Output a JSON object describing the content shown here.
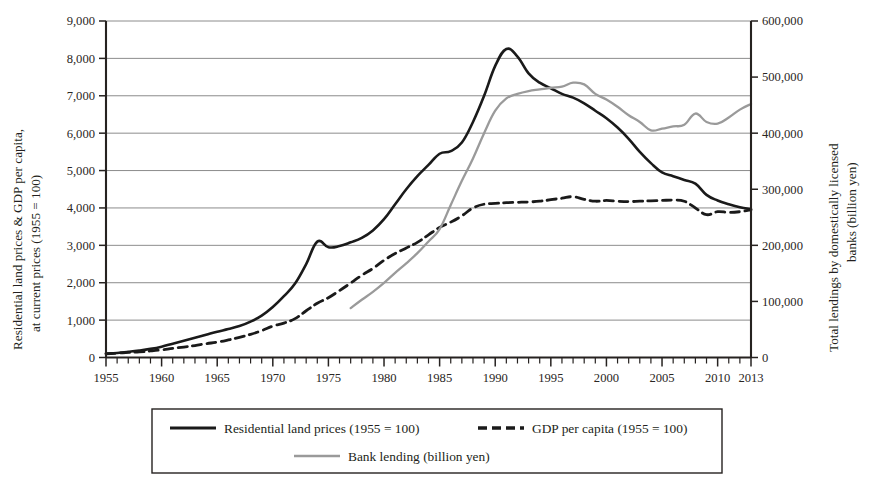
{
  "chart_data": {
    "type": "line",
    "title": "",
    "subtitle": "",
    "xlabel": "",
    "ylabel": "Residential land prices & GDP per capita, at current prices (1955 = 100)",
    "y2label": "Total lendings by domestically licensed banks (billion yen)",
    "xlim": [
      1955,
      2013
    ],
    "ylim": [
      0,
      9000
    ],
    "y2lim": [
      0,
      600000
    ],
    "grid": true,
    "grid_axis": "y",
    "legend_position": "bottom",
    "x_tick_labels": [
      "1955",
      "1960",
      "1965",
      "1970",
      "1975",
      "1980",
      "1985",
      "1990",
      "1995",
      "2000",
      "2005",
      "2010",
      "2013"
    ],
    "x_tick_values": [
      1955,
      1960,
      1965,
      1970,
      1975,
      1980,
      1985,
      1990,
      1995,
      2000,
      2005,
      2010,
      2013
    ],
    "x_minor_tick_step": 1,
    "y_tick_labels": [
      "0",
      "1,000",
      "2,000",
      "3,000",
      "4,000",
      "5,000",
      "6,000",
      "7,000",
      "8,000",
      "9,000"
    ],
    "y_tick_values": [
      0,
      1000,
      2000,
      3000,
      4000,
      5000,
      6000,
      7000,
      8000,
      9000
    ],
    "y2_tick_labels": [
      "0",
      "100,000",
      "200,000",
      "300,000",
      "400,000",
      "500,000",
      "600,000"
    ],
    "y2_tick_values": [
      0,
      100000,
      200000,
      300000,
      400000,
      500000,
      600000
    ],
    "series": [
      {
        "name": "Residential land prices (1955 = 100)",
        "axis": "left",
        "style": "solid",
        "color": "#1a1a1a",
        "width": 2.6,
        "x": [
          1955,
          1956,
          1957,
          1958,
          1959,
          1960,
          1961,
          1962,
          1963,
          1964,
          1965,
          1966,
          1967,
          1968,
          1969,
          1970,
          1971,
          1972,
          1973,
          1974,
          1975,
          1976,
          1977,
          1978,
          1979,
          1980,
          1981,
          1982,
          1983,
          1984,
          1985,
          1986,
          1987,
          1988,
          1989,
          1990,
          1991,
          1992,
          1993,
          1994,
          1995,
          1996,
          1997,
          1998,
          1999,
          2000,
          2001,
          2002,
          2003,
          2004,
          2005,
          2006,
          2007,
          2008,
          2009,
          2010,
          2011,
          2012,
          2013
        ],
        "values": [
          100,
          120,
          150,
          185,
          230,
          290,
          370,
          450,
          530,
          610,
          690,
          760,
          840,
          960,
          1120,
          1350,
          1640,
          1980,
          2500,
          3100,
          2950,
          2980,
          3080,
          3200,
          3400,
          3700,
          4100,
          4500,
          4850,
          5150,
          5450,
          5520,
          5750,
          6300,
          7000,
          7800,
          8250,
          8050,
          7600,
          7350,
          7200,
          7050,
          6950,
          6800,
          6600,
          6400,
          6150,
          5850,
          5500,
          5200,
          4950,
          4850,
          4750,
          4650,
          4350,
          4200,
          4100,
          4020,
          3970
        ]
      },
      {
        "name": "GDP per capita (1955 = 100)",
        "axis": "left",
        "style": "dashed",
        "color": "#1a1a1a",
        "width": 2.8,
        "x": [
          1955,
          1956,
          1957,
          1958,
          1959,
          1960,
          1961,
          1962,
          1963,
          1964,
          1965,
          1966,
          1967,
          1968,
          1969,
          1970,
          1971,
          1972,
          1973,
          1974,
          1975,
          1976,
          1977,
          1978,
          1979,
          1980,
          1981,
          1982,
          1983,
          1984,
          1985,
          1986,
          1987,
          1988,
          1989,
          1990,
          1991,
          1992,
          1993,
          1994,
          1995,
          1996,
          1997,
          1998,
          1999,
          2000,
          2001,
          2002,
          2003,
          2004,
          2005,
          2006,
          2007,
          2008,
          2009,
          2010,
          2011,
          2012,
          2013
        ],
        "values": [
          100,
          115,
          135,
          150,
          175,
          205,
          245,
          280,
          320,
          370,
          410,
          470,
          540,
          620,
          720,
          840,
          920,
          1040,
          1250,
          1450,
          1600,
          1790,
          1990,
          2200,
          2380,
          2600,
          2780,
          2930,
          3080,
          3280,
          3480,
          3620,
          3790,
          4000,
          4100,
          4120,
          4140,
          4150,
          4160,
          4180,
          4220,
          4260,
          4300,
          4230,
          4180,
          4200,
          4180,
          4170,
          4180,
          4190,
          4200,
          4210,
          4180,
          4000,
          3820,
          3900,
          3880,
          3900,
          3950
        ]
      },
      {
        "name": "Bank lending (billion yen)",
        "axis": "right",
        "style": "solid",
        "color": "#9a9a9a",
        "width": 2.3,
        "x": [
          1977,
          1978,
          1979,
          1980,
          1981,
          1982,
          1983,
          1984,
          1985,
          1986,
          1987,
          1988,
          1989,
          1990,
          1991,
          1992,
          1993,
          1994,
          1995,
          1996,
          1997,
          1998,
          1999,
          2000,
          2001,
          2002,
          2003,
          2004,
          2005,
          2006,
          2007,
          2008,
          2009,
          2010,
          2011,
          2012,
          2013
        ],
        "values": [
          88000,
          103000,
          117000,
          133000,
          151000,
          168000,
          186000,
          207000,
          229000,
          272000,
          315000,
          355000,
          400000,
          440000,
          462000,
          470000,
          475000,
          478000,
          481000,
          483000,
          490000,
          487000,
          470000,
          460000,
          447000,
          432000,
          420000,
          405000,
          408000,
          412000,
          415000,
          435000,
          420000,
          417000,
          428000,
          442000,
          452000
        ]
      }
    ]
  },
  "legend": {
    "items": [
      {
        "label": "Residential land prices (1955 = 100)",
        "style": "solid",
        "color": "#1a1a1a"
      },
      {
        "label": "GDP per capita (1955 = 100)",
        "style": "dashed",
        "color": "#1a1a1a"
      },
      {
        "label": "Bank lending (billion yen)",
        "style": "solid",
        "color": "#9a9a9a"
      }
    ]
  },
  "axes": {
    "left_title_line1": "Residential land prices & GDP per capita,",
    "left_title_line2": "at current prices (1955 = 100)",
    "right_title_line1": "Total lendings by domestically licensed",
    "right_title_line2": "banks (billion yen)"
  },
  "colors": {
    "series_primary": "#1a1a1a",
    "series_secondary": "#9a9a9a",
    "grid": "#6e6e6e",
    "axis": "#262220",
    "background": "#ffffff"
  }
}
